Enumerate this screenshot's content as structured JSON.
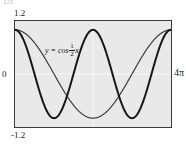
{
  "figure": {
    "caption_remnant": "121",
    "background_color": "#ffffff",
    "plot_background_color": "#e9e9e9",
    "frame_color": "#3a3a3a",
    "gridline_color": "#f7f7f7"
  },
  "axis_labels": {
    "y_max": "1.2",
    "y_min": "-1.2",
    "y_zero": "0",
    "x_max": "4π"
  },
  "curve_labels": {
    "cos_half_x": {
      "prefix": "y = cos",
      "numerator": "1",
      "denominator": "2",
      "variable": "x"
    },
    "cos_x": "y = cos x"
  },
  "chart_data": {
    "type": "line",
    "title": "",
    "xlabel": "",
    "ylabel": "",
    "xlim": [
      0,
      12.566370614359172
    ],
    "ylim": [
      -1.2,
      1.2
    ],
    "xtick_labels": [
      "0",
      "4π"
    ],
    "ytick_labels": [
      "-1.2",
      "1.2"
    ],
    "grid": true,
    "grid_note": "faint white gridlines at x = 2π and y = 0",
    "legend": "inline curve annotations",
    "series": [
      {
        "name": "y = cos x",
        "expression": "cos(x)",
        "color": "#161616",
        "line_width": 2.0,
        "periods_shown": 2,
        "x": [
          0,
          0.7853981634,
          1.5707963268,
          2.3561944902,
          3.1415926536,
          3.926990817,
          4.7123889804,
          5.4977871438,
          6.2831853072,
          7.0685834706,
          7.853981634,
          8.6393797974,
          9.4247779608,
          10.2101761242,
          10.9955742876,
          11.780972451,
          12.5663706144
        ],
        "y": [
          1.0,
          0.7071,
          0.0,
          -0.7071,
          -1.0,
          -0.7071,
          0.0,
          0.7071,
          1.0,
          0.7071,
          0.0,
          -0.7071,
          -1.0,
          -0.7071,
          0.0,
          0.7071,
          1.0
        ]
      },
      {
        "name": "y = cos (1/2)x",
        "expression": "cos(x/2)",
        "color": "#3c3c3c",
        "line_width": 1.2,
        "periods_shown": 1,
        "x": [
          0,
          1.5707963268,
          3.1415926536,
          4.7123889804,
          6.2831853072,
          7.853981634,
          9.4247779608,
          10.9955742876,
          12.5663706144
        ],
        "y": [
          1.0,
          0.7071,
          0.0,
          -0.7071,
          -1.0,
          -0.7071,
          0.0,
          0.7071,
          1.0
        ]
      }
    ],
    "annotations": [
      {
        "text": "y = cos 1/2 x",
        "x_frac": 0.1,
        "y_frac": 0.02
      },
      {
        "text": "y = cos x",
        "x_frac": 0.66,
        "y_frac": 0.85
      }
    ]
  }
}
